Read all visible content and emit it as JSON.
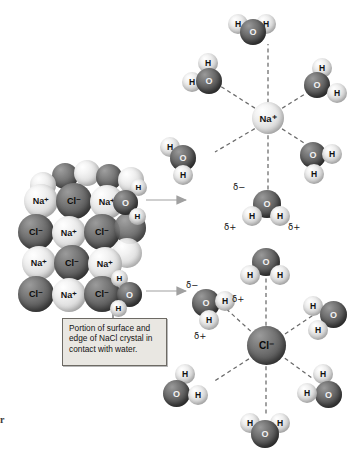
{
  "figure": {
    "background_color": "#ffffff",
    "edge_mark": "r"
  },
  "caption": {
    "text": "Portion of surface and edge of NaCl crystal in contact with water.",
    "background_color": "#e9e7e2",
    "border_color": "#6d6a64"
  },
  "labels": {
    "sodium": "Na⁺",
    "chloride": "Cl⁻",
    "oxygen": "O",
    "hydrogen": "H",
    "delta_negative": "δ−",
    "delta_positive": "δ+"
  },
  "colors": {
    "oxygen": "#5c5c5c",
    "hydrogen": "#e4e4e4",
    "sodium": "#e2e2e2",
    "chloride": "#5a5a5a",
    "arrow": "#9a9a9a",
    "bond_dash": "#6a6a6a"
  },
  "crystal": {
    "name": "NaCl crystal lattice",
    "rows": [
      {
        "ions": [
          "Na⁺",
          "Cl⁻",
          "Na⁺"
        ]
      },
      {
        "ions": [
          "Cl⁻",
          "Na⁺",
          "Cl⁻"
        ]
      },
      {
        "ions": [
          "Na⁺",
          "Cl⁻",
          "Na⁺"
        ]
      },
      {
        "ions": [
          "Cl⁻",
          "Na⁺",
          "Cl⁻"
        ]
      }
    ],
    "attached_water": [
      {
        "position": "upper-right-edge",
        "atoms": [
          "O",
          "H",
          "H"
        ]
      },
      {
        "position": "lower-right-edge",
        "atoms": [
          "O",
          "H",
          "H"
        ]
      }
    ]
  },
  "hydration_shells": [
    {
      "name": "sodium-hydration-shell",
      "center_ion": "Na⁺",
      "ion_type": "cation",
      "water_count": 6,
      "water_orientation": "oxygen atoms point toward the ion",
      "partial_charges": {
        "on_oxygen": "δ−",
        "on_hydrogen_left": "δ+",
        "on_hydrogen_right": "δ+"
      }
    },
    {
      "name": "chloride-hydration-shell",
      "center_ion": "Cl⁻",
      "ion_type": "anion",
      "water_count": 6,
      "water_orientation": "hydrogen atoms point toward the ion",
      "partial_charges": {
        "on_oxygen": "δ−",
        "on_hydrogen_upper": "δ+",
        "on_hydrogen_lower": "δ+"
      }
    }
  ],
  "arrows": [
    {
      "name": "arrow-to-sodium-shell",
      "from": "crystal surface",
      "to": "sodium hydration shell"
    },
    {
      "name": "arrow-to-chloride-shell",
      "from": "crystal edge",
      "to": "chloride hydration shell"
    }
  ]
}
